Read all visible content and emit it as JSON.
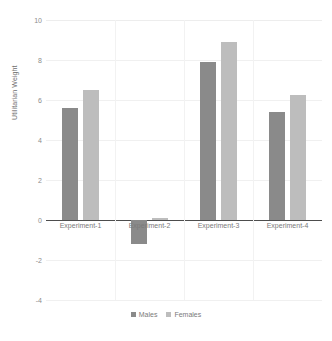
{
  "chart_data": {
    "type": "bar",
    "title": "",
    "xlabel": "",
    "ylabel": "Utilitarian Weight",
    "categories": [
      "Experiment-1",
      "Experiment-2",
      "Experiment-3",
      "Experiment-4"
    ],
    "series": [
      {
        "name": "Males",
        "color": "#8a8a8a",
        "values": [
          5.6,
          -1.2,
          7.9,
          5.4
        ]
      },
      {
        "name": "Females",
        "color": "#bdbdbd",
        "values": [
          6.5,
          0.1,
          8.9,
          6.25
        ]
      }
    ],
    "ylim": [
      -4,
      10
    ],
    "ytick_values": [
      10,
      8,
      6,
      4,
      2,
      0,
      -2,
      -4
    ],
    "ytick_labels": [
      "10",
      "8",
      "6",
      "4",
      "2",
      "0",
      "-2",
      "-4"
    ],
    "grid": true,
    "legend_position": "bottom"
  },
  "legend": {
    "entries": [
      {
        "label": "Males"
      },
      {
        "label": "Females"
      }
    ]
  },
  "axis": {
    "y_title": "Utilitarian Weight"
  }
}
